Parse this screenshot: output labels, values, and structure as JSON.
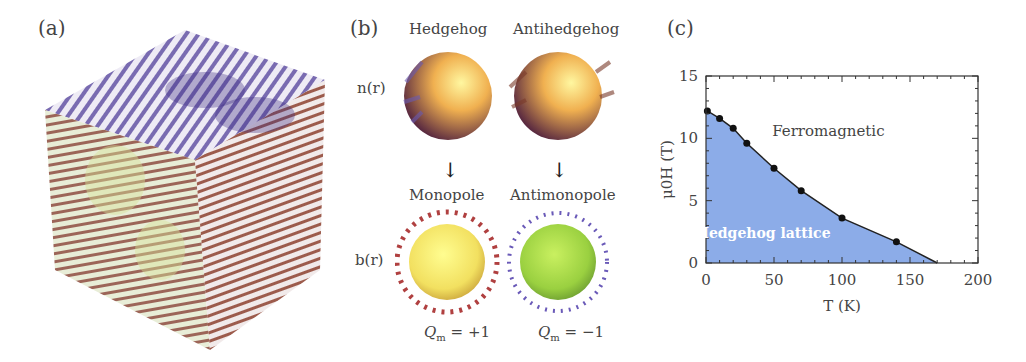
{
  "panels": {
    "a": {
      "label": "(a)",
      "description": "3D cube of magnetic texture arrows (hedgehog lattice)"
    },
    "b": {
      "label": "(b)",
      "col_headers": [
        "Hedgehog",
        "Antihedgehog"
      ],
      "row_label_top": "n(r)",
      "row_label_bottom": "b(r)",
      "bottom_headers": [
        "Monopole",
        "Antimonopole"
      ],
      "charges": [
        "Q_m = +1",
        "Q_m = −1"
      ],
      "charge_values": [
        "+1",
        "−1"
      ],
      "q_symbol": "Q",
      "q_sub": "m",
      "arrow": "↓"
    },
    "c": {
      "label": "(c)",
      "region_top": "Ferromagnetic",
      "region_bottom": "Hedgehog lattice",
      "xlabel": "T (K)",
      "ylabel": "μ0H (T)",
      "fill_color": "#7fa3e6",
      "line_color": "#222222"
    }
  },
  "chart_data": {
    "type": "area",
    "title": "",
    "xlabel": "T (K)",
    "ylabel": "μ0H (T)",
    "xlim": [
      0,
      200
    ],
    "ylim": [
      0,
      15
    ],
    "xticks": [
      0,
      50,
      100,
      150,
      200
    ],
    "yticks": [
      0,
      5,
      10,
      15
    ],
    "grid": false,
    "series": [
      {
        "name": "Phase boundary (Hedgehog lattice / Ferromagnetic)",
        "x": [
          1,
          10,
          20,
          30,
          50,
          70,
          100,
          140,
          170
        ],
        "y": [
          12.2,
          11.6,
          10.8,
          9.6,
          7.6,
          5.8,
          3.6,
          1.7,
          0
        ],
        "markers": [
          true,
          true,
          true,
          true,
          true,
          true,
          true,
          true,
          false
        ]
      }
    ],
    "annotations": [
      {
        "text": "Ferromagnetic",
        "x": 90,
        "y": 10.2
      },
      {
        "text": "Hedgehog lattice",
        "x": 42,
        "y": 2
      }
    ]
  }
}
